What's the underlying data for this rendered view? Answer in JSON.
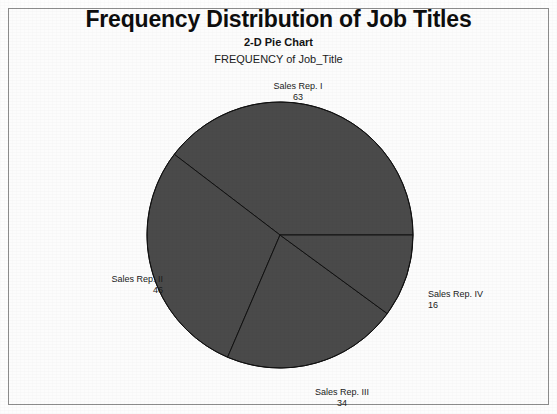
{
  "chart_data": {
    "type": "pie",
    "title": "Frequency Distribution of Job Titles",
    "subtitle": "2-D Pie Chart",
    "axis_title": "FREQUENCY of Job_Title",
    "categories": [
      "Sales Rep. I",
      "Sales Rep. II",
      "Sales Rep. III",
      "Sales Rep. IV"
    ],
    "values": [
      63,
      46,
      34,
      16
    ],
    "total": 159,
    "xlabel": "",
    "ylabel": "",
    "legend": "none",
    "grid": false,
    "slice_color": "#4a4a4a",
    "slice_border_color": "#111111",
    "start_angle_deg": 0,
    "direction": "counterclockwise",
    "slices": [
      {
        "label": "Sales Rep. I",
        "value": 63,
        "value_text": "63",
        "sweep_deg": 142.6,
        "color": "#4a4a4a"
      },
      {
        "label": "Sales Rep. II",
        "value": 46,
        "value_text": "46",
        "sweep_deg": 104.2,
        "color": "#4a4a4a"
      },
      {
        "label": "Sales Rep. III",
        "value": 34,
        "value_text": "34",
        "sweep_deg": 77.0,
        "color": "#4a4a4a"
      },
      {
        "label": "Sales Rep. IV",
        "value": 16,
        "value_text": "16",
        "sweep_deg": 36.2,
        "color": "#4a4a4a"
      }
    ]
  },
  "titles": {
    "main": "Frequency Distribution of Job Titles",
    "sub": "2-D Pie Chart",
    "axis": "FREQUENCY of Job_Title"
  },
  "labels": {
    "rep1": {
      "name": "Sales Rep. I",
      "value": "63"
    },
    "rep2": {
      "name": "Sales Rep. II",
      "value": "46"
    },
    "rep3": {
      "name": "Sales Rep. III",
      "value": "34"
    },
    "rep4": {
      "name": "Sales Rep. IV",
      "value": "16"
    }
  },
  "colors": {
    "slice_fill": "#4a4a4a",
    "slice_stroke": "#111111",
    "frame": "#8d8d8d",
    "background": "#fcfcfc",
    "text": "#1a1a1a"
  }
}
